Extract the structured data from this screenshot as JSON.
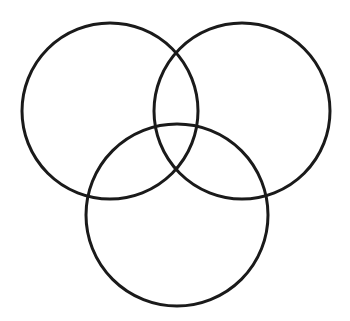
{
  "figure": {
    "kind": "venn-diagram",
    "background_color": "#ffffff",
    "stroke_color": "#1a1a1a",
    "stroke_width": 3,
    "fill": "none",
    "canvas": {
      "width": 350,
      "height": 321
    },
    "set_count": 3,
    "labels_present": false,
    "region_labels_present": false
  },
  "chart_data": {
    "type": "diagram",
    "subtype": "venn",
    "title": "",
    "xlabel": "",
    "ylabel": "",
    "legend": [],
    "annotations": [],
    "sets": [
      {
        "name": "top-left-set",
        "label": "",
        "cx": 110,
        "cy": 111,
        "r": 88,
        "stroke": "#1a1a1a",
        "fill": "none"
      },
      {
        "name": "top-right-set",
        "label": "",
        "cx": 242,
        "cy": 111,
        "r": 88,
        "stroke": "#1a1a1a",
        "fill": "none"
      },
      {
        "name": "bottom-set",
        "label": "",
        "cx": 177,
        "cy": 215,
        "r": 91,
        "stroke": "#1a1a1a",
        "fill": "none"
      }
    ],
    "intersections": [
      {
        "name": "top-left-and-top-right",
        "x": 177,
        "y": 49
      },
      {
        "name": "top-left-and-bottom",
        "x": 90,
        "y": 199
      },
      {
        "name": "top-right-and-bottom",
        "x": 264,
        "y": 199
      },
      {
        "name": "center-triple",
        "x": 177,
        "y": 183
      }
    ],
    "region_counts": [],
    "values": []
  }
}
